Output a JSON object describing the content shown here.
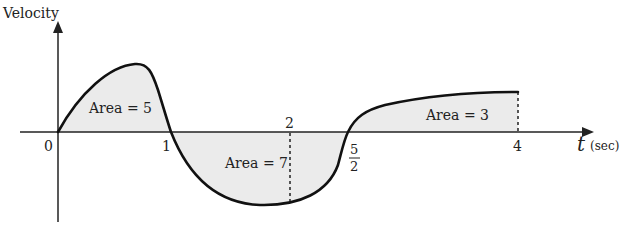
{
  "diagram": {
    "y_axis_label": "Velocity",
    "x_axis_label_var": "t",
    "x_axis_label_unit": "(sec)",
    "ticks": {
      "t0": "0",
      "t1": "1",
      "t2": "2",
      "t52_num": "5",
      "t52_den": "2",
      "t4": "4"
    },
    "regions": [
      {
        "label": "Area = 5",
        "from": 0,
        "to": 1,
        "sign": "positive"
      },
      {
        "label": "Area = 7",
        "from": 1,
        "to": 2.5,
        "sign": "negative"
      },
      {
        "label": "Area = 3",
        "from": 2.5,
        "to": 4,
        "sign": "positive"
      }
    ],
    "colors": {
      "fill": "#ebebeb",
      "curve": "#111111",
      "axis": "#222222"
    }
  }
}
